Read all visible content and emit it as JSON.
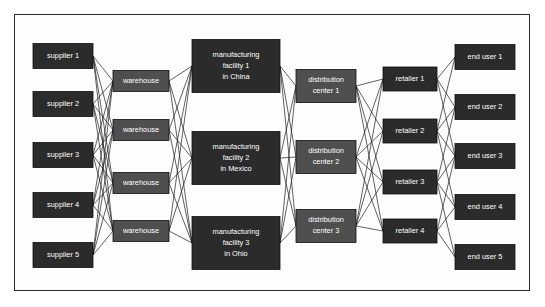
{
  "diagram": {
    "colors": {
      "dark_node": "#2b2b2b",
      "mid_node": "#4f4f4f",
      "node_text": "#ffffff",
      "edge": "#1d1d1d",
      "frame_border": "#2b2b2b",
      "background": "#ffffff"
    },
    "columns": [
      {
        "name": "suppliers",
        "shade": "dark",
        "x": 33,
        "width": 60,
        "box_height": 25,
        "nodes": [
          {
            "id": "s1",
            "lines": [
              "supplier 1"
            ],
            "cy": 56
          },
          {
            "id": "s2",
            "lines": [
              "supplier 2"
            ],
            "cy": 104
          },
          {
            "id": "s3",
            "lines": [
              "supplier 3"
            ],
            "cy": 155
          },
          {
            "id": "s4",
            "lines": [
              "supplier 4"
            ],
            "cy": 205
          },
          {
            "id": "s5",
            "lines": [
              "supplier 5"
            ],
            "cy": 255
          }
        ]
      },
      {
        "name": "warehouses",
        "shade": "mid",
        "x": 113,
        "width": 56,
        "box_height": 21,
        "nodes": [
          {
            "id": "w1",
            "lines": [
              "warehouse"
            ],
            "cy": 81
          },
          {
            "id": "w2",
            "lines": [
              "warehouse"
            ],
            "cy": 130
          },
          {
            "id": "w3",
            "lines": [
              "warehouse"
            ],
            "cy": 183
          },
          {
            "id": "w4",
            "lines": [
              "warehouse"
            ],
            "cy": 231
          }
        ]
      },
      {
        "name": "manufacturing-facilities",
        "shade": "dark",
        "x": 192,
        "width": 88,
        "box_height": 53,
        "nodes": [
          {
            "id": "m1",
            "lines": [
              "manufacturing",
              "facility 1",
              "in China"
            ],
            "cy": 66
          },
          {
            "id": "m2",
            "lines": [
              "manufacturing",
              "facility 2",
              "in Mexico"
            ],
            "cy": 158
          },
          {
            "id": "m3",
            "lines": [
              "manufacturing",
              "facility 3",
              "in Ohio"
            ],
            "cy": 243
          }
        ]
      },
      {
        "name": "distribution-centers",
        "shade": "mid",
        "x": 296,
        "width": 60,
        "box_height": 33,
        "nodes": [
          {
            "id": "d1",
            "lines": [
              "distribution",
              "center 1"
            ],
            "cy": 86
          },
          {
            "id": "d2",
            "lines": [
              "distribution",
              "center 2"
            ],
            "cy": 157
          },
          {
            "id": "d3",
            "lines": [
              "distribution",
              "center 3"
            ],
            "cy": 226
          }
        ]
      },
      {
        "name": "retailers",
        "shade": "dark",
        "x": 383,
        "width": 54,
        "box_height": 24,
        "nodes": [
          {
            "id": "r1",
            "lines": [
              "retailer 1"
            ],
            "cy": 79
          },
          {
            "id": "r2",
            "lines": [
              "retailer 2"
            ],
            "cy": 131
          },
          {
            "id": "r3",
            "lines": [
              "retailer 3"
            ],
            "cy": 182
          },
          {
            "id": "r4",
            "lines": [
              "retailer 4"
            ],
            "cy": 231
          }
        ]
      },
      {
        "name": "end-users",
        "shade": "dark",
        "x": 455,
        "width": 60,
        "box_height": 25,
        "nodes": [
          {
            "id": "e1",
            "lines": [
              "end user 1"
            ],
            "cy": 57
          },
          {
            "id": "e2",
            "lines": [
              "end user 2"
            ],
            "cy": 107
          },
          {
            "id": "e3",
            "lines": [
              "end user 3"
            ],
            "cy": 156
          },
          {
            "id": "e4",
            "lines": [
              "end user 4"
            ],
            "cy": 207
          },
          {
            "id": "e5",
            "lines": [
              "end user 5"
            ],
            "cy": 257
          }
        ]
      }
    ],
    "edges": [
      [
        "s1",
        "w1"
      ],
      [
        "s1",
        "w2"
      ],
      [
        "s1",
        "w3"
      ],
      [
        "s1",
        "w4"
      ],
      [
        "s2",
        "w1"
      ],
      [
        "s2",
        "w2"
      ],
      [
        "s2",
        "w3"
      ],
      [
        "s2",
        "w4"
      ],
      [
        "s3",
        "w1"
      ],
      [
        "s3",
        "w2"
      ],
      [
        "s3",
        "w3"
      ],
      [
        "s3",
        "w4"
      ],
      [
        "s4",
        "w1"
      ],
      [
        "s4",
        "w2"
      ],
      [
        "s4",
        "w3"
      ],
      [
        "s4",
        "w4"
      ],
      [
        "s5",
        "w1"
      ],
      [
        "s5",
        "w2"
      ],
      [
        "s5",
        "w3"
      ],
      [
        "s5",
        "w4"
      ],
      [
        "w1",
        "m1"
      ],
      [
        "w1",
        "m2"
      ],
      [
        "w1",
        "m3"
      ],
      [
        "w2",
        "m1"
      ],
      [
        "w2",
        "m2"
      ],
      [
        "w2",
        "m3"
      ],
      [
        "w3",
        "m1"
      ],
      [
        "w3",
        "m2"
      ],
      [
        "w3",
        "m3"
      ],
      [
        "w4",
        "m1"
      ],
      [
        "w4",
        "m2"
      ],
      [
        "w4",
        "m3"
      ],
      [
        "m1",
        "d1"
      ],
      [
        "m1",
        "d2"
      ],
      [
        "m1",
        "d3"
      ],
      [
        "m2",
        "d1"
      ],
      [
        "m2",
        "d2"
      ],
      [
        "m2",
        "d3"
      ],
      [
        "m3",
        "d1"
      ],
      [
        "m3",
        "d2"
      ],
      [
        "m3",
        "d3"
      ],
      [
        "d1",
        "r1"
      ],
      [
        "d1",
        "r2"
      ],
      [
        "d1",
        "r3"
      ],
      [
        "d1",
        "r4"
      ],
      [
        "d2",
        "r1"
      ],
      [
        "d2",
        "r2"
      ],
      [
        "d2",
        "r3"
      ],
      [
        "d2",
        "r4"
      ],
      [
        "d3",
        "r1"
      ],
      [
        "d3",
        "r2"
      ],
      [
        "d3",
        "r3"
      ],
      [
        "d3",
        "r4"
      ],
      [
        "r1",
        "e1"
      ],
      [
        "r1",
        "e2"
      ],
      [
        "r1",
        "e3"
      ],
      [
        "r2",
        "e1"
      ],
      [
        "r2",
        "e2"
      ],
      [
        "r2",
        "e3"
      ],
      [
        "r2",
        "e4"
      ],
      [
        "r3",
        "e2"
      ],
      [
        "r3",
        "e3"
      ],
      [
        "r3",
        "e4"
      ],
      [
        "r3",
        "e5"
      ],
      [
        "r4",
        "e3"
      ],
      [
        "r4",
        "e4"
      ],
      [
        "r4",
        "e5"
      ]
    ]
  }
}
